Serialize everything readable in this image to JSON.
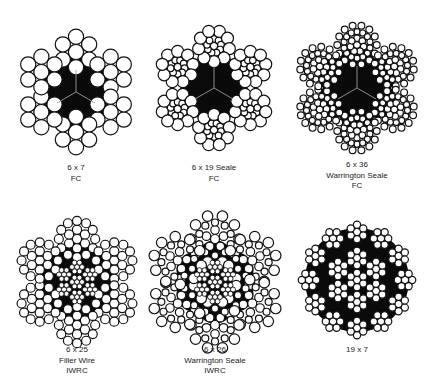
{
  "figures": [
    {
      "id": "6x7-fc",
      "center": [
        76,
        92
      ],
      "caption_top": 163,
      "labels": [
        "6 x 7",
        "FC"
      ],
      "core": "fc",
      "strand": {
        "type": "6x7",
        "dist": 40,
        "outer_r": 7.6,
        "inner_r": 7.6
      },
      "outer_strands": 6
    },
    {
      "id": "6x19-seale-fc",
      "center": [
        214,
        88
      ],
      "caption_top": 163,
      "labels": [
        "6 x 19 Seale",
        "FC"
      ],
      "core": "fc",
      "strand": {
        "type": "seale19",
        "dist": 42,
        "outer_r": 6.0,
        "mid_r": 3.3,
        "inner_r": 3.6
      },
      "outer_strands": 6
    },
    {
      "id": "6x36-warrington-seale-fc",
      "center": [
        357,
        88
      ],
      "caption_top": 160,
      "labels": [
        "6 x 36",
        "Warrington Seale",
        "FC"
      ],
      "core": "fc",
      "strand": {
        "type": "ws36",
        "dist": 43,
        "r": 3.4
      },
      "outer_strands": 6
    },
    {
      "id": "6x25-filler-wire-iwrc",
      "center": [
        77,
        282
      ],
      "caption_top": 345,
      "labels": [
        "6 x 25",
        "Filler Wire",
        "IWRC"
      ],
      "core": "iwrc",
      "strand": {
        "type": "filler25",
        "dist": 43,
        "r": 4.6
      },
      "outer_strands": 6
    },
    {
      "id": "6x26-warrington-seale-iwrc",
      "center": [
        215,
        282
      ],
      "caption_top": 345,
      "labels": [
        "6 x 26",
        "Warrington Seale",
        "IWRC"
      ],
      "core": "iwrc",
      "strand": {
        "type": "ws26",
        "dist": 43,
        "r": 5.0
      },
      "outer_strands": 6
    },
    {
      "id": "19x7",
      "center": [
        357,
        280
      ],
      "caption_top": 345,
      "labels": [
        "19 x 7"
      ],
      "core": "19x7",
      "strand": {
        "type": "6x7",
        "r": 3.6
      },
      "outer_strands": 19
    }
  ],
  "colors": {
    "wire_fill": "#ffffff",
    "wire_stroke": "#111111",
    "core_fill": "#0a0a0a",
    "background": "#ffffff"
  }
}
